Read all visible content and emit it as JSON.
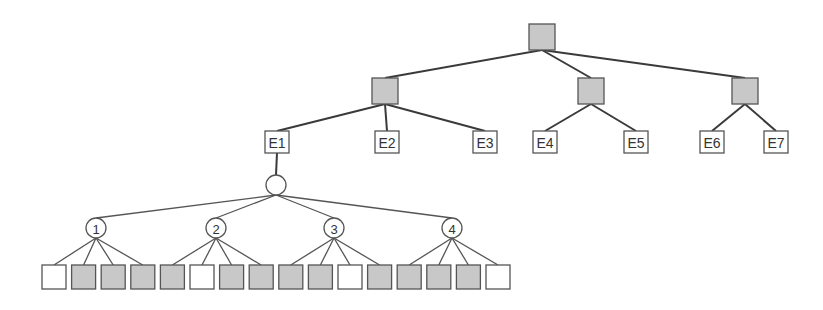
{
  "diagram": {
    "type": "tree",
    "colors": {
      "decision_fill": "#c8c8c8",
      "leaf_fill": "#ffffff",
      "stroke": "#555555",
      "edge": "#3a3a3a"
    },
    "root": {
      "id": "root",
      "x": 542,
      "y": 37,
      "fill": "gray"
    },
    "level1": [
      {
        "id": "g1",
        "x": 385,
        "y": 91,
        "fill": "gray"
      },
      {
        "id": "g2",
        "x": 591,
        "y": 91,
        "fill": "gray"
      },
      {
        "id": "g3",
        "x": 745,
        "y": 91,
        "fill": "gray"
      }
    ],
    "e_nodes": [
      {
        "id": "E1",
        "label": "E1",
        "x": 277,
        "y": 142,
        "parent": "g1"
      },
      {
        "id": "E2",
        "label": "E2",
        "x": 387,
        "y": 142,
        "parent": "g1"
      },
      {
        "id": "E3",
        "label": "E3",
        "x": 485,
        "y": 142,
        "parent": "g1"
      },
      {
        "id": "E4",
        "label": "E4",
        "x": 545,
        "y": 142,
        "parent": "g2"
      },
      {
        "id": "E5",
        "label": "E5",
        "x": 636,
        "y": 142,
        "parent": "g2"
      },
      {
        "id": "E6",
        "label": "E6",
        "x": 712,
        "y": 142,
        "parent": "g3"
      },
      {
        "id": "E7",
        "label": "E7",
        "x": 776,
        "y": 142,
        "parent": "g3"
      }
    ],
    "hub": {
      "id": "hub",
      "x": 276,
      "y": 185,
      "r": 10,
      "parent": "E1"
    },
    "numbered": [
      {
        "id": "n1",
        "label": "1",
        "x": 96,
        "y": 228
      },
      {
        "id": "n2",
        "label": "2",
        "x": 216,
        "y": 228
      },
      {
        "id": "n3",
        "label": "3",
        "x": 334,
        "y": 228
      },
      {
        "id": "n4",
        "label": "4",
        "x": 452,
        "y": 228
      }
    ],
    "leaves": [
      {
        "parent": "n1",
        "fill": "white"
      },
      {
        "parent": "n1",
        "fill": "gray"
      },
      {
        "parent": "n1",
        "fill": "gray"
      },
      {
        "parent": "n1",
        "fill": "gray"
      },
      {
        "parent": "n2",
        "fill": "gray"
      },
      {
        "parent": "n2",
        "fill": "white"
      },
      {
        "parent": "n2",
        "fill": "gray"
      },
      {
        "parent": "n2",
        "fill": "gray"
      },
      {
        "parent": "n3",
        "fill": "gray"
      },
      {
        "parent": "n3",
        "fill": "gray"
      },
      {
        "parent": "n3",
        "fill": "white"
      },
      {
        "parent": "n3",
        "fill": "gray"
      },
      {
        "parent": "n4",
        "fill": "gray"
      },
      {
        "parent": "n4",
        "fill": "gray"
      },
      {
        "parent": "n4",
        "fill": "gray"
      },
      {
        "parent": "n4",
        "fill": "white"
      }
    ],
    "leaf_layout": {
      "start_x": 54,
      "step": 29.6,
      "y": 277,
      "size": 24
    },
    "box_size": 26,
    "e_box": {
      "w": 24,
      "h": 22
    }
  }
}
